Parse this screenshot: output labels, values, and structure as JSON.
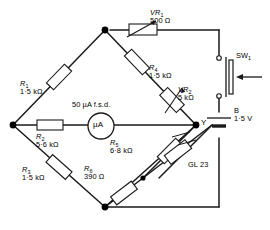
{
  "diagram": {
    "stroke_color": "#1a1a1a",
    "node_color": "#000000"
  },
  "components": {
    "r1": {
      "ref": "R",
      "sub": "1",
      "value": "1·5 kΩ",
      "type": "resistor"
    },
    "r2": {
      "ref": "R",
      "sub": "2",
      "value": "5·6 kΩ",
      "type": "resistor"
    },
    "r3": {
      "ref": "R",
      "sub": "3",
      "value": "1·5 kΩ",
      "type": "resistor"
    },
    "r4": {
      "ref": "R",
      "sub": "4",
      "value": "1·5 kΩ",
      "type": "resistor"
    },
    "r5": {
      "ref": "R",
      "sub": "5",
      "value": "6·8 kΩ",
      "type": "resistor"
    },
    "r6": {
      "ref": "R",
      "sub": "6",
      "value": "390 Ω",
      "type": "resistor"
    },
    "vr1": {
      "ref": "VR",
      "sub": "1",
      "value": "500 Ω",
      "type": "variable-resistor"
    },
    "vr2": {
      "ref": "VR",
      "sub": "2",
      "value": "5 kΩ",
      "type": "variable-resistor"
    },
    "ldr": {
      "ref": "GL 23",
      "type": "light-dependent-resistor"
    },
    "meter": {
      "symbol": "µA",
      "rating": "50 µA f.s.d.",
      "type": "microammeter"
    },
    "switch": {
      "ref": "SW",
      "sub": "1",
      "type": "push-switch"
    },
    "battery": {
      "ref": "B",
      "value": "1·5 V",
      "type": "cell"
    },
    "node_y": {
      "label": "Y",
      "type": "junction-label"
    }
  }
}
